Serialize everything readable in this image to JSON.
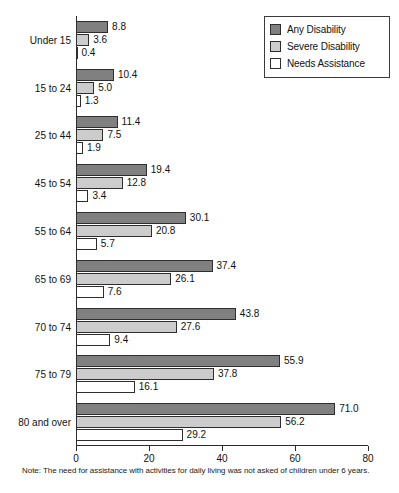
{
  "chart_data": {
    "type": "bar",
    "orientation": "horizontal",
    "title": "",
    "xlabel": "",
    "ylabel": "Age (Percent)",
    "xlim": [
      0,
      80
    ],
    "xticks": [
      0,
      20,
      40,
      60,
      80
    ],
    "grid": false,
    "legend_position": "top-right",
    "categories": [
      "Under 15",
      "15 to 24",
      "25 to 44",
      "45 to 54",
      "55 to 64",
      "65 to 69",
      "70 to 74",
      "75 to 79",
      "80 and over"
    ],
    "series": [
      {
        "name": "Any Disability",
        "color": "#808080",
        "values": [
          8.8,
          10.4,
          11.4,
          19.4,
          30.1,
          37.4,
          43.8,
          55.9,
          71.0
        ]
      },
      {
        "name": "Severe Disability",
        "color": "#cccccc",
        "values": [
          3.6,
          5.0,
          7.5,
          12.8,
          20.8,
          26.1,
          27.6,
          37.8,
          56.2
        ]
      },
      {
        "name": "Needs Assistance",
        "color": "#ffffff",
        "values": [
          0.4,
          1.3,
          1.9,
          3.4,
          5.7,
          7.6,
          9.4,
          16.1,
          29.2
        ]
      }
    ],
    "note": "Note: The need for assistance with activities for daily living was not asked of children under 6 years."
  }
}
